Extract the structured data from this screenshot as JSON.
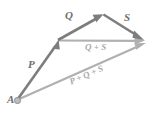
{
  "figure": {
    "kind": "vector-addition-diagram",
    "width": 153,
    "height": 115,
    "background_color": "#ffffff"
  },
  "colors": {
    "vector_dark": "#7d7d7d",
    "vector_light": "#b0b0b0",
    "label_dark": "#6e6e6e",
    "label_light": "#a8a8a8",
    "point_fill": "#b5b5b5",
    "point_stroke": "#8a8a8a"
  },
  "labels": {
    "origin": "A",
    "p": "P",
    "q": "Q",
    "s": "S",
    "q_plus_s": "Q + S",
    "p_plus_q_plus_s": "P + Q + S"
  },
  "points": {
    "A": {
      "x": 17,
      "y": 100
    },
    "B": {
      "x": 58,
      "y": 40
    },
    "C": {
      "x": 103,
      "y": 14
    },
    "D": {
      "x": 143,
      "y": 41
    },
    "D_low": {
      "x": 145,
      "y": 44
    }
  },
  "vectors": [
    {
      "name": "P",
      "from": "A",
      "to": "B",
      "label": "P",
      "weight": "dark",
      "stroke": 2.6
    },
    {
      "name": "Q",
      "from": "B",
      "to": "C",
      "label": "Q",
      "weight": "dark",
      "stroke": 2.6
    },
    {
      "name": "S",
      "from": "C",
      "to": "D",
      "label": "S",
      "weight": "dark",
      "stroke": 2.6
    },
    {
      "name": "Q+S",
      "from": "B",
      "to": "D",
      "label": "Q + S",
      "weight": "light",
      "stroke": 2.2
    },
    {
      "name": "P+Q+S",
      "from": "A",
      "to": "D_low",
      "label": "P + Q + S",
      "weight": "light",
      "stroke": 2.2
    }
  ]
}
